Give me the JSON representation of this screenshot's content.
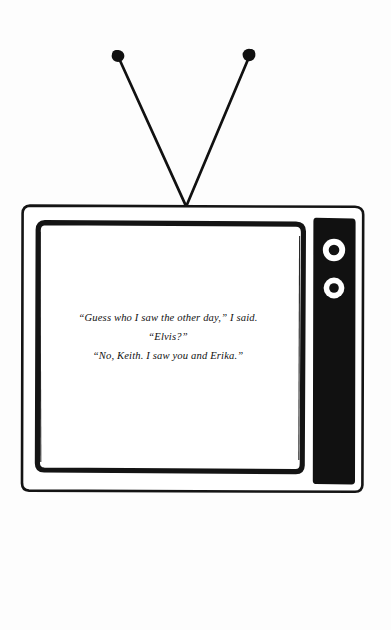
{
  "scene": {
    "title": "Television set cartoon with rabbit-ear antenna",
    "background_color": "#fdfdfd",
    "ink_color": "#111111"
  },
  "antenna": {
    "name": "rabbit-ear-antenna",
    "left_rod": {
      "tip_x": 118,
      "tip_y": 56,
      "base_x": 186,
      "base_y": 206
    },
    "right_rod": {
      "tip_x": 249,
      "tip_y": 55,
      "base_x": 186,
      "base_y": 206
    },
    "tip_left_label": "antenna-tip-left",
    "tip_right_label": "antenna-tip-right",
    "tip_radius": 6,
    "tip_color": "#111111"
  },
  "television": {
    "name": "television-set",
    "cabinet": {
      "x": 22,
      "y": 205,
      "width": 341,
      "height": 287
    },
    "screen_bezel": {
      "x": 37,
      "y": 222,
      "width": 266,
      "height": 250
    },
    "screen": {
      "x": 44,
      "y": 229,
      "width": 252,
      "height": 236,
      "color": "#ffffff"
    },
    "control_panel": {
      "name": "control-panel",
      "x": 313,
      "y": 216,
      "width": 42,
      "height": 269,
      "color": "#111111"
    },
    "knobs": [
      {
        "label": "tuner-knob-upper",
        "cx": 334,
        "cy": 250,
        "outer_r": 11,
        "inner_r": 5
      },
      {
        "label": "volume-knob-lower",
        "cx": 334,
        "cy": 288,
        "outer_r": 10,
        "inner_r": 4.5
      }
    ],
    "knob_ring_color": "#ffffff",
    "knob_center_color": "#111111"
  },
  "screen_text": {
    "name": "on-screen-dialogue",
    "lines": [
      "“Guess who I saw the other day,” I said.",
      "“Elvis?”",
      "“No, Keith. I saw you and Erika.”"
    ],
    "line_1": "“Guess who I saw the other day,” I said.",
    "line_2": "“Elvis?”",
    "line_3": "“No, Keith. I saw you and Erika.”",
    "alignment": "center",
    "style": "italic serif"
  }
}
